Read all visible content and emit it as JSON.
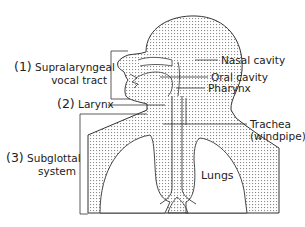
{
  "diagram": {
    "type": "anatomical-schematic",
    "regions": [
      {
        "number": "(1)",
        "line1": "Supralaryngeal",
        "line2": "vocal tract"
      },
      {
        "number": "(2)",
        "line1": "Larynx"
      },
      {
        "number": "(3)",
        "line1": "Subglottal",
        "line2": "system"
      }
    ],
    "structures": {
      "nasal": "Nasal cavity",
      "oral": "Oral cavity",
      "pharynx": "Pharynx",
      "trachea_line1": "Trachea",
      "trachea_line2": "(windpipe)",
      "lungs": "Lungs"
    },
    "colors": {
      "line": "#333333",
      "stipple": "#9a9a9a",
      "background": "#ffffff"
    }
  }
}
